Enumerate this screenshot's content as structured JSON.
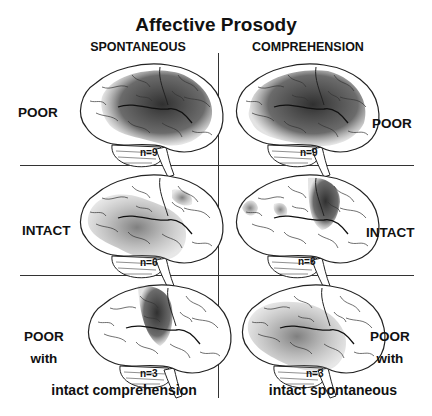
{
  "title": "Affective Prosody",
  "columns": [
    {
      "label": "SPONTANEOUS"
    },
    {
      "label": "COMPREHENSION"
    }
  ],
  "rows": [
    {
      "label": "POOR",
      "cells": [
        {
          "n": "n=9",
          "shading": "frontal, parietal and temporal regions, dense"
        },
        {
          "n": "n=9",
          "shading": "frontal, parietal and temporal regions, dense"
        }
      ]
    },
    {
      "label": "INTACT",
      "cells": [
        {
          "n": "n=6",
          "shading": "posterior temporal and parietal, moderate"
        },
        {
          "n": "n=6",
          "shading": "frontal, moderate"
        }
      ]
    },
    {
      "label_line1": "POOR",
      "label_line2": "with",
      "cells": [
        {
          "n": "n=3",
          "shading": "frontal, focal",
          "caption": "intact comprehension"
        },
        {
          "n": "n=3",
          "shading": "temporal and parietal, moderate",
          "caption": "intact spontaneous"
        }
      ]
    }
  ],
  "colors": {
    "lesion_dense": "#2f2f2f",
    "lesion_moderate": "#6a6a6a",
    "outline": "#222222",
    "background": "#ffffff"
  }
}
